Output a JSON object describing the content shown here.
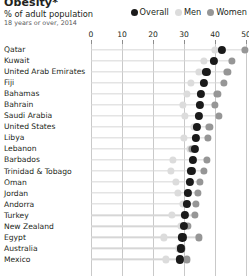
{
  "header": {
    "title": "Obesity*",
    "subtitle": "% of adult population",
    "note": "18 years or over, 2014"
  },
  "legend": {
    "items": [
      {
        "label": "Overall",
        "color": "#1a1a1a",
        "name": "legend-overall"
      },
      {
        "label": "Men",
        "color": "#dcdcdc",
        "name": "legend-men"
      },
      {
        "label": "Women",
        "color": "#969696",
        "name": "legend-women"
      }
    ]
  },
  "chart_data": {
    "type": "scatter",
    "title": "Obesity*",
    "subtitle": "% of adult population",
    "note": "18 years or over, 2014",
    "xlabel": "",
    "ylabel": "",
    "xlim": [
      0,
      50
    ],
    "xticks": [
      0,
      10,
      20,
      30,
      40,
      50
    ],
    "xtick_labels": [
      "0",
      "10",
      "20",
      "30",
      "40",
      "50"
    ],
    "grid": true,
    "legend_position": "top-right",
    "series": [
      {
        "name": "Overall",
        "color": "#1a1a1a"
      },
      {
        "name": "Men",
        "color": "#dcdcdc"
      },
      {
        "name": "Women",
        "color": "#969696"
      }
    ],
    "categories": [
      "Qatar",
      "Kuwait",
      "United Arab Emirates",
      "Fiji",
      "Bahamas",
      "Bahrain",
      "Saudi Arabia",
      "United States",
      "Libya",
      "Lebanon",
      "Barbados",
      "Trinidad & Tobago",
      "Oman",
      "Jordan",
      "Andorra",
      "Turkey",
      "New Zealand",
      "Egypt",
      "Australia",
      "Mexico"
    ],
    "rows": [
      {
        "country": "Qatar",
        "overall": 42.3,
        "men": 40.0,
        "women": 49.7
      },
      {
        "country": "Kuwait",
        "overall": 39.7,
        "men": 36.4,
        "women": 45.4
      },
      {
        "country": "United Arab Emirates",
        "overall": 37.2,
        "men": 34.8,
        "women": 44.0
      },
      {
        "country": "Fiji",
        "overall": 36.4,
        "men": 32.1,
        "women": 42.9
      },
      {
        "country": "Bahamas",
        "overall": 35.5,
        "men": 31.0,
        "women": 40.8
      },
      {
        "country": "Bahrain",
        "overall": 35.1,
        "men": 29.6,
        "women": 40.1
      },
      {
        "country": "Saudi Arabia",
        "overall": 34.7,
        "men": 30.3,
        "women": 41.3
      },
      {
        "country": "United States",
        "overall": 34.2,
        "men": 33.2,
        "women": 38.2
      },
      {
        "country": "Libya",
        "overall": 33.9,
        "men": 30.1,
        "women": 37.8
      },
      {
        "country": "Lebanon",
        "overall": 33.4,
        "men": 31.8,
        "women": 32.6
      },
      {
        "country": "Barbados",
        "overall": 33.0,
        "men": 26.3,
        "women": 37.4
      },
      {
        "country": "Trinidad & Tobago",
        "overall": 32.4,
        "men": 25.7,
        "women": 36.4
      },
      {
        "country": "Oman",
        "overall": 31.8,
        "men": 27.4,
        "women": 35.0
      },
      {
        "country": "Jordan",
        "overall": 31.3,
        "men": 28.1,
        "women": 34.6
      },
      {
        "country": "Andorra",
        "overall": 30.9,
        "men": 29.7,
        "women": 33.9
      },
      {
        "country": "Turkey",
        "overall": 30.4,
        "men": 26.0,
        "women": 33.5
      },
      {
        "country": "New Zealand",
        "overall": 30.0,
        "men": 28.9,
        "women": 31.2
      },
      {
        "country": "Egypt",
        "overall": 29.5,
        "men": 23.4,
        "women": 34.8
      },
      {
        "country": "Australia",
        "overall": 29.0,
        "men": 28.4,
        "women": 29.3
      },
      {
        "country": "Mexico",
        "overall": 28.6,
        "men": 24.2,
        "women": 31.0
      }
    ]
  }
}
